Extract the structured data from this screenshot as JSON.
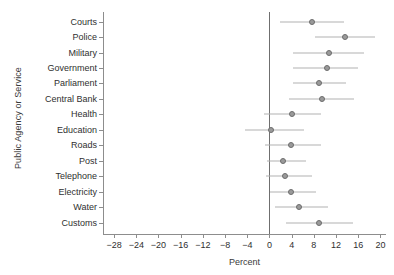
{
  "chart_data": {
    "type": "scatter",
    "title": "",
    "xlabel": "Percent",
    "ylabel": "Public Agency or Service",
    "xlim": [
      -30,
      21
    ],
    "xticks": [
      -28,
      -24,
      -20,
      -16,
      -12,
      -8,
      -4,
      0,
      4,
      8,
      12,
      16,
      20
    ],
    "xticklabels": [
      "-28",
      "-24",
      "-20",
      "-16",
      "-12",
      "-8",
      "-4",
      "0",
      "4",
      "8",
      "12",
      "16",
      "20"
    ],
    "grid": false,
    "legend": null,
    "zero_reference_line": 0,
    "marker_color": "#9a9a9a",
    "marker_edge_color": "#6d6d6d",
    "ci_color": "#b2b2b2",
    "axis_color": "#8d8d8d",
    "categories": [
      "Courts",
      "Police",
      "Military",
      "Government",
      "Parliament",
      "Central Bank",
      "Health",
      "Education",
      "Roads",
      "Post",
      "Telephone",
      "Electricity",
      "Water",
      "Customs"
    ],
    "values": [
      7.6,
      13.6,
      10.7,
      10.3,
      8.9,
      9.4,
      4.0,
      0.3,
      3.9,
      2.4,
      2.8,
      3.9,
      5.4,
      9.0
    ],
    "ci_low": [
      1.9,
      8.2,
      4.3,
      4.3,
      4.2,
      3.6,
      -0.9,
      -4.5,
      -0.8,
      -0.4,
      -0.6,
      0.1,
      1.0,
      3.0
    ],
    "ci_high": [
      13.4,
      19.0,
      17.1,
      16.0,
      13.8,
      15.3,
      9.2,
      6.3,
      9.2,
      6.5,
      7.6,
      8.4,
      10.5,
      15.1
    ]
  }
}
